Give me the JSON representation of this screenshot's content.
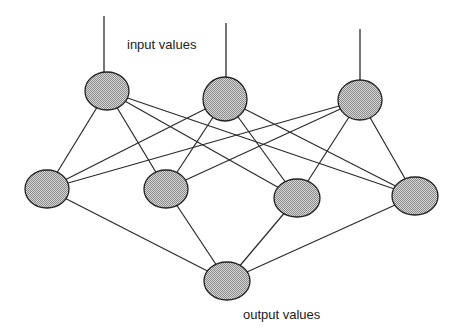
{
  "diagram": {
    "title": "",
    "labels": {
      "input": "input values",
      "output": "output values"
    },
    "colors": {
      "background": "#ffffff",
      "edge": "#2a2a2a",
      "node_fill": "#b4b4b4",
      "node_stroke": "#222222",
      "text": "#222222"
    },
    "layers": {
      "input": [
        {
          "id": "i1",
          "cx": 107,
          "cy": 91,
          "rx": 22,
          "ry": 19,
          "input_line_top": 16,
          "input_line_x": 104
        },
        {
          "id": "i2",
          "cx": 225,
          "cy": 99,
          "rx": 22,
          "ry": 22,
          "input_line_top": 23,
          "input_line_x": 226
        },
        {
          "id": "i3",
          "cx": 360,
          "cy": 100,
          "rx": 22,
          "ry": 20,
          "input_line_top": 29,
          "input_line_x": 360
        }
      ],
      "hidden": [
        {
          "id": "h1",
          "cx": 47,
          "cy": 189,
          "rx": 22,
          "ry": 19
        },
        {
          "id": "h2",
          "cx": 166,
          "cy": 189,
          "rx": 22,
          "ry": 19
        },
        {
          "id": "h3",
          "cx": 297,
          "cy": 198,
          "rx": 23,
          "ry": 19
        },
        {
          "id": "h4",
          "cx": 415,
          "cy": 196,
          "rx": 23,
          "ry": 19
        }
      ],
      "output": [
        {
          "id": "o1",
          "cx": 227,
          "cy": 281,
          "rx": 23,
          "ry": 19
        }
      ]
    },
    "edges": [
      [
        "i1",
        "h1"
      ],
      [
        "i1",
        "h2"
      ],
      [
        "i1",
        "h3"
      ],
      [
        "i1",
        "h4"
      ],
      [
        "i2",
        "h1"
      ],
      [
        "i2",
        "h2"
      ],
      [
        "i2",
        "h3"
      ],
      [
        "i2",
        "h4"
      ],
      [
        "i3",
        "h1"
      ],
      [
        "i3",
        "h2"
      ],
      [
        "i3",
        "h3"
      ],
      [
        "i3",
        "h4"
      ],
      [
        "h1",
        "o1"
      ],
      [
        "h2",
        "o1"
      ],
      [
        "h3",
        "o1"
      ],
      [
        "h4",
        "o1"
      ]
    ]
  }
}
